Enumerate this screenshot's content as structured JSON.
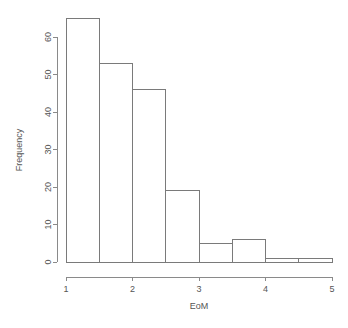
{
  "chart_data": {
    "type": "bar",
    "title": "",
    "subtitle": "",
    "xlabel": "EoM",
    "ylabel": "Frequency",
    "xlim": [
      1,
      5
    ],
    "ylim": [
      0,
      65
    ],
    "grid": false,
    "legend": "none",
    "bin_width": 0.5,
    "bin_edges": [
      1,
      1.5,
      2,
      2.5,
      3,
      3.5,
      4,
      4.5,
      5
    ],
    "categories": [
      "1-1.5",
      "1.5-2",
      "2-2.5",
      "2.5-3",
      "3-3.5",
      "3.5-4",
      "4-4.5",
      "4.5-5"
    ],
    "values": [
      65,
      53,
      46,
      19,
      5,
      6,
      1,
      1
    ],
    "xticks": [
      "1",
      "2",
      "3",
      "4",
      "5"
    ],
    "xtick_values": [
      1,
      2,
      3,
      4,
      5
    ],
    "yticks": [
      "0",
      "10",
      "20",
      "30",
      "40",
      "50",
      "60"
    ],
    "ytick_values": [
      0,
      10,
      20,
      30,
      40,
      50,
      60
    ]
  },
  "axes": {
    "y_title": "Frequency",
    "x_title": "EoM",
    "y_labels": [
      "0",
      "10",
      "20",
      "30",
      "40",
      "50",
      "60"
    ],
    "x_labels": [
      "1",
      "2",
      "3",
      "4",
      "5"
    ]
  },
  "colors": {
    "background": "#ffffff",
    "axis": "#8a8a8a",
    "bar_stroke": "#7a7a7a",
    "bar_fill": "#ffffff",
    "text": "#555555"
  }
}
